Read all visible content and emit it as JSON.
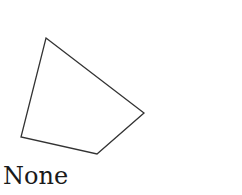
{
  "diagram": {
    "shape": "quadrilateral",
    "vertices": [
      [
        46,
        38
      ],
      [
        144,
        113
      ],
      [
        97,
        154
      ],
      [
        21,
        137
      ]
    ],
    "stroke_color": "#333333",
    "fill_color": "none"
  },
  "caption": {
    "text": "None"
  }
}
